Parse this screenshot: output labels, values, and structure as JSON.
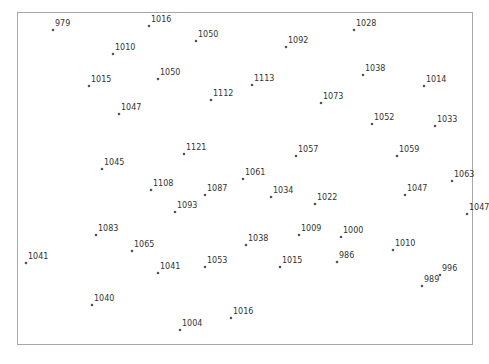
{
  "chart_data": {
    "type": "scatter",
    "title": "",
    "xlabel": "",
    "ylabel": "",
    "grid": false,
    "legend": null,
    "frame": {
      "left": 17,
      "top": 12,
      "right": 473,
      "bottom": 345,
      "color": "#a8a8a8"
    },
    "point_color": "#555555",
    "label_color": "#333333",
    "points": [
      {
        "x": 53,
        "y": 30,
        "label": "979"
      },
      {
        "x": 149,
        "y": 26,
        "label": "1016"
      },
      {
        "x": 196,
        "y": 41,
        "label": "1050"
      },
      {
        "x": 113,
        "y": 54,
        "label": "1010"
      },
      {
        "x": 89,
        "y": 86,
        "label": "1015"
      },
      {
        "x": 158,
        "y": 79,
        "label": "1050"
      },
      {
        "x": 211,
        "y": 100,
        "label": "1112"
      },
      {
        "x": 119,
        "y": 114,
        "label": "1047"
      },
      {
        "x": 252,
        "y": 85,
        "label": "1113"
      },
      {
        "x": 286,
        "y": 47,
        "label": "1092"
      },
      {
        "x": 354,
        "y": 30,
        "label": "1028"
      },
      {
        "x": 363,
        "y": 75,
        "label": "1038"
      },
      {
        "x": 321,
        "y": 103,
        "label": "1073"
      },
      {
        "x": 424,
        "y": 86,
        "label": "1014"
      },
      {
        "x": 372,
        "y": 124,
        "label": "1052"
      },
      {
        "x": 435,
        "y": 126,
        "label": "1033"
      },
      {
        "x": 184,
        "y": 154,
        "label": "1121"
      },
      {
        "x": 102,
        "y": 169,
        "label": "1045"
      },
      {
        "x": 296,
        "y": 156,
        "label": "1057"
      },
      {
        "x": 397,
        "y": 156,
        "label": "1059"
      },
      {
        "x": 243,
        "y": 179,
        "label": "1061"
      },
      {
        "x": 452,
        "y": 181,
        "label": "1063"
      },
      {
        "x": 151,
        "y": 190,
        "label": "1108"
      },
      {
        "x": 205,
        "y": 195,
        "label": "1087"
      },
      {
        "x": 271,
        "y": 197,
        "label": "1034"
      },
      {
        "x": 405,
        "y": 195,
        "label": "1047"
      },
      {
        "x": 315,
        "y": 204,
        "label": "1022"
      },
      {
        "x": 175,
        "y": 212,
        "label": "1093"
      },
      {
        "x": 467,
        "y": 214,
        "label": "1047"
      },
      {
        "x": 96,
        "y": 235,
        "label": "1083"
      },
      {
        "x": 299,
        "y": 235,
        "label": "1009"
      },
      {
        "x": 341,
        "y": 237,
        "label": "1000"
      },
      {
        "x": 246,
        "y": 245,
        "label": "1038"
      },
      {
        "x": 132,
        "y": 251,
        "label": "1065"
      },
      {
        "x": 393,
        "y": 250,
        "label": "1010"
      },
      {
        "x": 26,
        "y": 263,
        "label": "1041"
      },
      {
        "x": 337,
        "y": 262,
        "label": "986"
      },
      {
        "x": 205,
        "y": 267,
        "label": "1053"
      },
      {
        "x": 280,
        "y": 267,
        "label": "1015"
      },
      {
        "x": 158,
        "y": 273,
        "label": "1041"
      },
      {
        "x": 440,
        "y": 275,
        "label": "996"
      },
      {
        "x": 422,
        "y": 286,
        "label": "989"
      },
      {
        "x": 92,
        "y": 305,
        "label": "1040"
      },
      {
        "x": 231,
        "y": 318,
        "label": "1016"
      },
      {
        "x": 180,
        "y": 330,
        "label": "1004"
      }
    ]
  }
}
